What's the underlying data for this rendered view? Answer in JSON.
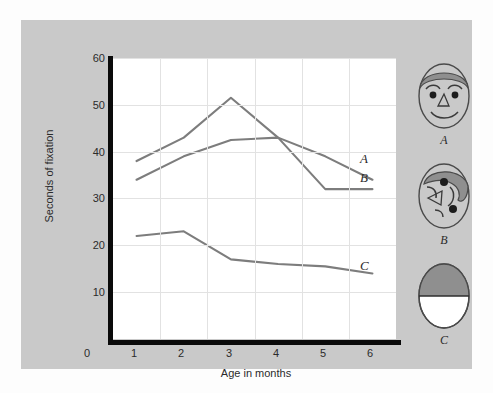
{
  "chart_data": {
    "type": "line",
    "title": "",
    "xlabel": "Age in months",
    "ylabel": "Seconds of fixation",
    "xlim": [
      0,
      6
    ],
    "ylim": [
      0,
      60
    ],
    "xticks": [
      0,
      1,
      2,
      3,
      4,
      5,
      6
    ],
    "yticks": [
      10,
      20,
      30,
      40,
      50,
      60
    ],
    "grid": true,
    "legend_position": "right-margin-stimuli",
    "line_color": "#7d7d7d",
    "series": [
      {
        "name": "A",
        "label": "A",
        "description": "normal face",
        "x": [
          0.5,
          1.5,
          2.5,
          3.5,
          4.5,
          5.5
        ],
        "values": [
          38,
          43,
          51.5,
          43,
          39,
          34
        ]
      },
      {
        "name": "B",
        "label": "B",
        "description": "scrambled face",
        "x": [
          0.5,
          1.5,
          2.5,
          3.5,
          4.5,
          5.5
        ],
        "values": [
          34,
          39,
          42.5,
          43,
          32,
          32
        ]
      },
      {
        "name": "C",
        "label": "C",
        "description": "control oval, half shaded",
        "x": [
          0.5,
          1.5,
          2.5,
          3.5,
          4.5,
          5.5
        ],
        "values": [
          22,
          23,
          17,
          16,
          15.5,
          14
        ]
      }
    ]
  },
  "axes": {
    "y_label": "Seconds of fixation",
    "x_label": "Age in months",
    "y_tick_labels": [
      "60",
      "50",
      "40",
      "30",
      "20",
      "10"
    ],
    "x_tick_labels": [
      "0",
      "1",
      "2",
      "3",
      "4",
      "5",
      "6"
    ]
  },
  "curve_labels": {
    "a": "A",
    "b": "B",
    "c": "C"
  },
  "stimuli": [
    {
      "caption": "A",
      "kind": "normal-face"
    },
    {
      "caption": "B",
      "kind": "scrambled-face"
    },
    {
      "caption": "C",
      "kind": "half-shaded-oval"
    }
  ],
  "colors": {
    "panel": "#c9c9c9",
    "plot_background": "#ffffff",
    "axis": "#0a0a0a",
    "grid": "#e2e2e2",
    "line": "#7d7d7d",
    "stimulus_fill": "#c9c9c9",
    "stimulus_stroke": "#4a4a4a",
    "hair": "#8f8f8f"
  }
}
